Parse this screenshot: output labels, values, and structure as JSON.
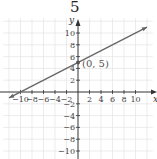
{
  "problem_number": "5",
  "chart_data": {
    "type": "line",
    "title": "",
    "xlabel": "x",
    "ylabel": "y",
    "xlim": [
      -10,
      10
    ],
    "ylim": [
      -10,
      10
    ],
    "grid": true,
    "x_ticks": [
      -10,
      -8,
      -6,
      -4,
      -2,
      2,
      4,
      6,
      8,
      10
    ],
    "y_ticks": [
      -10,
      -8,
      -6,
      -4,
      -2,
      2,
      4,
      6,
      8,
      10
    ],
    "series": [
      {
        "name": "line",
        "equation": "y = 0.5x + 5",
        "slope": 0.5,
        "intercept": 5,
        "x": [
          -12,
          12
        ],
        "y": [
          -1,
          11
        ],
        "color": "#666666",
        "arrows": "both"
      }
    ],
    "points": [
      {
        "x": 0,
        "y": 5,
        "label": "(0, 5)"
      }
    ]
  }
}
